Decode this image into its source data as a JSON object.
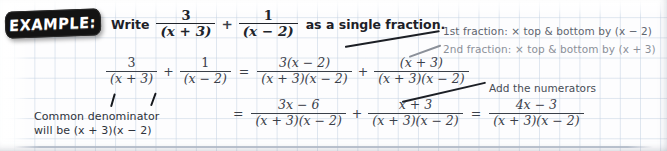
{
  "badge": {
    "label": "EXAMPLE:"
  },
  "prompt": {
    "lead": "Write",
    "tail": "as a single fraction.",
    "fraction_1": {
      "numerator": "3",
      "denominator": "(x + 3)"
    },
    "operator": "+",
    "fraction_2": {
      "numerator": "1",
      "denominator": "(x − 2)"
    }
  },
  "work": {
    "line1": {
      "f1": {
        "numerator": "3",
        "denominator": "(x + 3)"
      },
      "op1": "+",
      "f2": {
        "numerator": "1",
        "denominator": "(x − 2)"
      },
      "eq1": "=",
      "f3": {
        "numerator": "3(x − 2)",
        "denominator": "(x + 3)(x − 2)"
      },
      "op2": "+",
      "f4": {
        "numerator": "(x + 3)",
        "denominator": "(x + 3)(x − 2)"
      }
    },
    "line2": {
      "eq1": "=",
      "f1": {
        "numerator": "3x − 6",
        "denominator": "(x + 3)(x − 2)"
      },
      "op1": "+",
      "f2": {
        "numerator": "x + 3",
        "denominator": "(x + 3)(x − 2)"
      },
      "eq2": "=",
      "f3": {
        "numerator": "4x − 3",
        "denominator": "(x + 3)(x − 2)"
      }
    }
  },
  "annotations": {
    "first_fraction": "1st fraction: × top & bottom by (x − 2)",
    "second_fraction": "2nd fraction: × top & bottom by (x + 3)",
    "add_numerators": "Add the numerators",
    "common_denominator": "Common denominator will be (x + 3)(x − 2)"
  },
  "colors": {
    "badge_background": "#131313",
    "badge_text": "#ffffff",
    "grid_line": "#c4d2e2",
    "math_primary": "#20242b",
    "math_secondary": "#3a4049",
    "annotation_grey": "#5d646e",
    "annotation_faded": "#8b9099",
    "page_background": "#fdfdfe"
  }
}
